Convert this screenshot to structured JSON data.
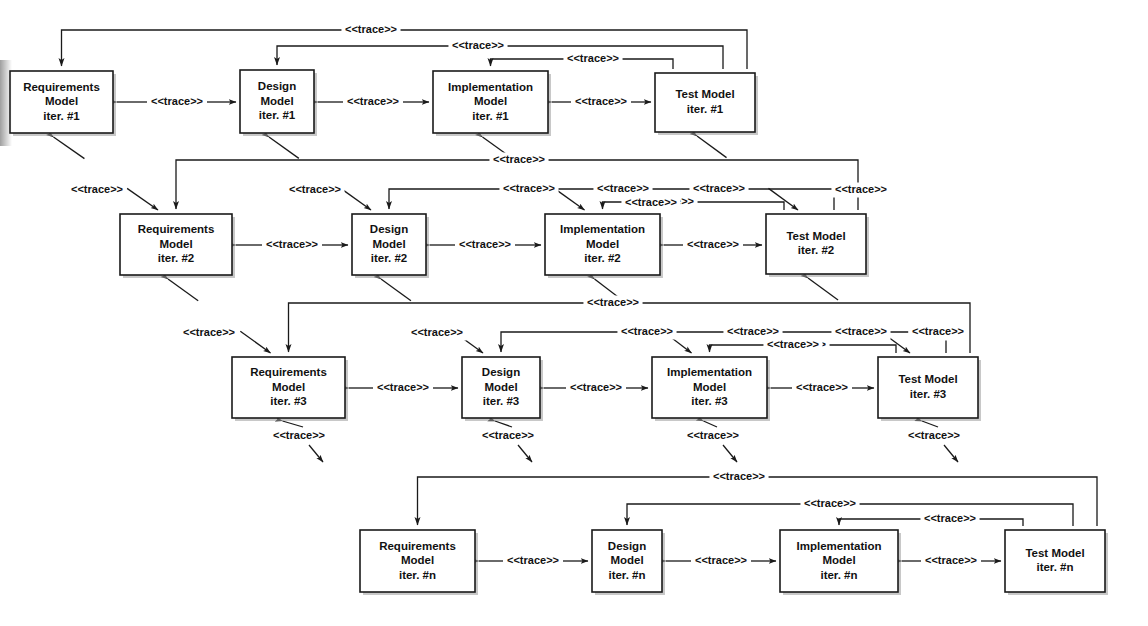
{
  "diagram": {
    "trace_label": "<<trace>>",
    "stereotype": "trace",
    "colors": {
      "stroke": "#1a1a1a",
      "box_fill": "#ffffff",
      "text": "#111111",
      "shadow": "#9a9a9a"
    },
    "model_names": {
      "requirements": "Requirements",
      "design": "Design",
      "implementation": "Implementation",
      "test": "Test Model",
      "model_word": "Model"
    },
    "iterations": [
      "iter. #1",
      "iter. #2",
      "iter. #3",
      "iter. #n"
    ],
    "rows": [
      {
        "iteration": "iter. #1",
        "boxes": [
          {
            "id": "req-1",
            "lines": [
              "Requirements",
              "Model",
              "iter. #1"
            ],
            "x": 10,
            "y": 71,
            "w": 103,
            "h": 62
          },
          {
            "id": "des-1",
            "lines": [
              "Design",
              "Model",
              "iter. #1"
            ],
            "x": 240,
            "y": 70,
            "w": 74,
            "h": 63
          },
          {
            "id": "impl-1",
            "lines": [
              "Implementation",
              "Model",
              "iter. #1"
            ],
            "x": 433,
            "y": 71,
            "w": 115,
            "h": 62
          },
          {
            "id": "test-1",
            "lines": [
              "Test Model",
              "iter. #1"
            ],
            "x": 655,
            "y": 73,
            "w": 100,
            "h": 59
          }
        ]
      },
      {
        "iteration": "iter. #2",
        "boxes": [
          {
            "id": "req-2",
            "lines": [
              "Requirements",
              "Model",
              "iter. #2"
            ],
            "x": 120,
            "y": 214,
            "w": 112,
            "h": 61
          },
          {
            "id": "des-2",
            "lines": [
              "Design",
              "Model",
              "iter. #2"
            ],
            "x": 352,
            "y": 214,
            "w": 74,
            "h": 61
          },
          {
            "id": "impl-2",
            "lines": [
              "Implementation",
              "Model",
              "iter. #2"
            ],
            "x": 545,
            "y": 214,
            "w": 115,
            "h": 61
          },
          {
            "id": "test-2",
            "lines": [
              "Test Model",
              "iter. #2"
            ],
            "x": 766,
            "y": 214,
            "w": 100,
            "h": 60
          }
        ]
      },
      {
        "iteration": "iter. #3",
        "boxes": [
          {
            "id": "req-3",
            "lines": [
              "Requirements",
              "Model",
              "iter. #3"
            ],
            "x": 232,
            "y": 357,
            "w": 113,
            "h": 61
          },
          {
            "id": "des-3",
            "lines": [
              "Design",
              "Model",
              "iter. #3"
            ],
            "x": 462,
            "y": 357,
            "w": 78,
            "h": 61
          },
          {
            "id": "impl-3",
            "lines": [
              "Implementation",
              "Model",
              "iter. #3"
            ],
            "x": 652,
            "y": 357,
            "w": 115,
            "h": 61
          },
          {
            "id": "test-3",
            "lines": [
              "Test Model",
              "iter. #3"
            ],
            "x": 878,
            "y": 357,
            "w": 100,
            "h": 61
          }
        ]
      },
      {
        "iteration": "iter. #n",
        "boxes": [
          {
            "id": "req-n",
            "lines": [
              "Requirements",
              "Model",
              "iter. #n"
            ],
            "x": 360,
            "y": 530,
            "w": 115,
            "h": 62
          },
          {
            "id": "des-n",
            "lines": [
              "Design",
              "Model",
              "iter. #n"
            ],
            "x": 592,
            "y": 530,
            "w": 70,
            "h": 62
          },
          {
            "id": "impl-n",
            "lines": [
              "Implementation",
              "Model",
              "iter. #n"
            ],
            "x": 780,
            "y": 530,
            "w": 118,
            "h": 62
          },
          {
            "id": "test-n",
            "lines": [
              "Test Model",
              "iter. #n"
            ],
            "x": 1005,
            "y": 530,
            "w": 100,
            "h": 62
          }
        ]
      }
    ],
    "horizontal_traces": [
      {
        "row": 1,
        "from": "req-1",
        "to": "des-1",
        "label": "<<trace>>",
        "lx": 177,
        "ly": 102
      },
      {
        "row": 1,
        "from": "des-1",
        "to": "impl-1",
        "label": "<<trace>>",
        "lx": 373,
        "ly": 102
      },
      {
        "row": 1,
        "from": "impl-1",
        "to": "test-1",
        "label": "<<trace>>",
        "lx": 601,
        "ly": 102
      },
      {
        "row": 2,
        "from": "req-2",
        "to": "des-2",
        "label": "<<trace>>",
        "lx": 292,
        "ly": 245
      },
      {
        "row": 2,
        "from": "des-2",
        "to": "impl-2",
        "label": "<<trace>>",
        "lx": 485,
        "ly": 245
      },
      {
        "row": 2,
        "from": "impl-2",
        "to": "test-2",
        "label": "<<trace>>",
        "lx": 713,
        "ly": 245
      },
      {
        "row": 3,
        "from": "req-3",
        "to": "des-3",
        "label": "<<trace>>",
        "lx": 403,
        "ly": 388
      },
      {
        "row": 3,
        "from": "des-3",
        "to": "impl-3",
        "label": "<<trace>>",
        "lx": 596,
        "ly": 388
      },
      {
        "row": 3,
        "from": "impl-3",
        "to": "test-3",
        "label": "<<trace>>",
        "lx": 822,
        "ly": 388
      },
      {
        "row": 4,
        "from": "req-n",
        "to": "des-n",
        "label": "<<trace>>",
        "lx": 533,
        "ly": 561
      },
      {
        "row": 4,
        "from": "des-n",
        "to": "impl-n",
        "label": "<<trace>>",
        "lx": 721,
        "ly": 561
      },
      {
        "row": 4,
        "from": "impl-n",
        "to": "test-n",
        "label": "<<trace>>",
        "lx": 951,
        "ly": 561
      }
    ],
    "diagonal_traces": [
      {
        "from": "req-1",
        "to": "req-2",
        "label": "<<trace>>",
        "lx": 97,
        "ly": 190
      },
      {
        "from": "des-1",
        "to": "des-2",
        "label": "<<trace>>",
        "lx": 315,
        "ly": 190
      },
      {
        "from": "impl-1",
        "to": "impl-2",
        "label": "<<trace>>",
        "lx": 651,
        "ly": 203
      },
      {
        "from": "test-1",
        "to": "test-2",
        "label": "<<trace>>",
        "lx": 861,
        "ly": 190
      },
      {
        "from": "req-2",
        "to": "req-3",
        "label": "<<trace>>",
        "lx": 209,
        "ly": 333
      },
      {
        "from": "des-2",
        "to": "des-3",
        "label": "<<trace>>",
        "lx": 437,
        "ly": 333
      },
      {
        "from": "impl-2",
        "to": "impl-3",
        "label": "<<trace>>",
        "lx": 793,
        "ly": 345
      },
      {
        "from": "test-2",
        "to": "test-3",
        "label": "<<trace>>",
        "lx": 938,
        "ly": 333
      }
    ],
    "dangling_traces": [
      {
        "from": "req-3",
        "label": "<<trace>>",
        "lx": 299,
        "ly": 436
      },
      {
        "from": "des-3",
        "label": "<<trace>>",
        "lx": 508,
        "ly": 436
      },
      {
        "from": "impl-3",
        "label": "<<trace>>",
        "lx": 713,
        "ly": 436
      },
      {
        "from": "test-3",
        "label": "<<trace>>",
        "lx": 934,
        "ly": 436
      }
    ],
    "overhead_arcs": [
      {
        "row": 1,
        "from": "test-1",
        "to": "req-1",
        "label": "<<trace>>",
        "lx": 371,
        "ly": 30
      },
      {
        "row": 1,
        "from": "test-1",
        "to": "des-1",
        "label": "<<trace>>",
        "lx": 478,
        "ly": 46
      },
      {
        "row": 1,
        "from": "test-1",
        "to": "impl-1",
        "label": "<<trace>>",
        "lx": 593,
        "ly": 59
      },
      {
        "row": 2,
        "from": "test-2",
        "to": "req-2",
        "label": "<<trace>>",
        "lx": 519,
        "ly": 160
      },
      {
        "row": 2,
        "from": "test-2",
        "to": "des-2",
        "label": "<<trace>>",
        "lx": 529,
        "ly": 189
      },
      {
        "row": 2,
        "from": "test-2",
        "to": "impl-2",
        "label": "<<trace>>",
        "lx": 668,
        "ly": 202
      },
      {
        "row": 3,
        "from": "test-3",
        "to": "req-3",
        "label": "<<trace>>",
        "lx": 613,
        "ly": 303
      },
      {
        "row": 3,
        "from": "test-3",
        "to": "des-3",
        "label": "<<trace>>",
        "lx": 647,
        "ly": 332
      },
      {
        "row": 3,
        "from": "test-3",
        "to": "impl-3",
        "label": "<<trace>>",
        "lx": 800,
        "ly": 345
      },
      {
        "row": 4,
        "from": "test-n",
        "to": "req-n",
        "label": "<<trace>>",
        "lx": 739,
        "ly": 477
      },
      {
        "row": 4,
        "from": "test-n",
        "to": "des-n",
        "label": "<<trace>>",
        "lx": 830,
        "ly": 504
      },
      {
        "row": 4,
        "from": "test-n",
        "to": "impl-n",
        "label": "<<trace>>",
        "lx": 950,
        "ly": 519
      }
    ],
    "extra_arc_labels": [
      {
        "label": "<<trace>>",
        "lx": 623,
        "ly": 189
      },
      {
        "label": "<<trace>>",
        "lx": 719,
        "ly": 189
      },
      {
        "label": "<<trace>>",
        "lx": 753,
        "ly": 332
      },
      {
        "label": "<<trace>>",
        "lx": 861,
        "ly": 332
      },
      {
        "label": "<<trace>>",
        "lx": 938,
        "ly": 332
      }
    ]
  }
}
